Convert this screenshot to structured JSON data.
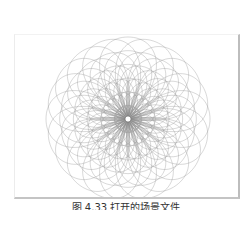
{
  "figure": {
    "caption": "图 4.33  打开的场景文件",
    "colors": {
      "background": "#ffffff",
      "stroke": "#8c8c8c",
      "frame_shadow": "#bdbdbd",
      "center": "#ffffff"
    },
    "flower": {
      "center_x": 113,
      "center_y": 84,
      "petal_count": 20,
      "loops_per_petal": 6,
      "outer_radius": 82,
      "center_radius": 3
    }
  }
}
